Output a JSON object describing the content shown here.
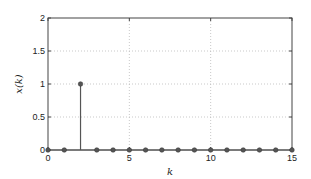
{
  "chart_data": {
    "type": "stem",
    "title": "",
    "xlabel": "k",
    "ylabel": "x(k)",
    "xlim": [
      0,
      15
    ],
    "ylim": [
      0,
      2
    ],
    "grid": true,
    "xticks": [
      "0",
      "5",
      "10",
      "15"
    ],
    "yticks": [
      "0",
      "0.5",
      "1",
      "1.5",
      "2"
    ],
    "x": [
      0,
      1,
      2,
      3,
      4,
      5,
      6,
      7,
      8,
      9,
      10,
      11,
      12,
      13,
      14,
      15
    ],
    "values": [
      0,
      0,
      1,
      0,
      0,
      0,
      0,
      0,
      0,
      0,
      0,
      0,
      0,
      0,
      0,
      0
    ],
    "colors": {
      "stem": "#555555",
      "grid": "#bbbbbb",
      "axes": "#444444"
    }
  }
}
